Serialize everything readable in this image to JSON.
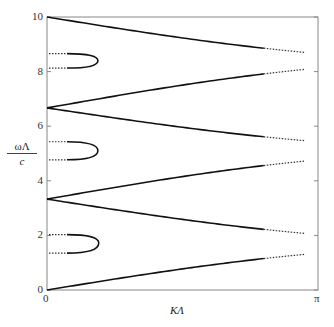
{
  "chart_data": {
    "type": "line",
    "title": "",
    "xlabel": "KΛ",
    "ylabel_numerator": "ωΛ",
    "ylabel_denominator": "c",
    "xlim": [
      0,
      3.14159
    ],
    "ylim": [
      0,
      10
    ],
    "grid": false,
    "legend": null,
    "x_ticks": [
      {
        "value": 0,
        "label": "0"
      },
      {
        "value": 3.14159,
        "label": "π"
      }
    ],
    "y_ticks": [
      {
        "value": 0,
        "label": "0"
      },
      {
        "value": 2,
        "label": "2"
      },
      {
        "value": 4,
        "label": "4"
      },
      {
        "value": 6,
        "label": "6"
      },
      {
        "value": 8,
        "label": "8"
      },
      {
        "value": 10,
        "label": "10"
      }
    ],
    "series": [
      {
        "name": "band-1",
        "style": "solid-then-dotted",
        "x_start": 0,
        "y_start": 0,
        "x_end": 3.14159,
        "y_end": 1.35
      },
      {
        "name": "band-2",
        "style": "solid-then-dotted",
        "x_start": 0,
        "y_start": 3.33,
        "x_end": 3.14159,
        "y_end": 2.03
      },
      {
        "name": "band-3",
        "style": "solid-then-dotted",
        "x_start": 0,
        "y_start": 3.33,
        "x_end": 3.14159,
        "y_end": 4.77
      },
      {
        "name": "band-4",
        "style": "solid-then-dotted",
        "x_start": 0,
        "y_start": 6.67,
        "x_end": 3.14159,
        "y_end": 5.43
      },
      {
        "name": "band-5",
        "style": "solid-then-dotted",
        "x_start": 0,
        "y_start": 6.67,
        "x_end": 3.14159,
        "y_end": 8.13
      },
      {
        "name": "band-6",
        "style": "solid-then-dotted",
        "x_start": 0,
        "y_start": 10,
        "x_end": 3.14159,
        "y_end": 8.66
      }
    ],
    "gap_loops": [
      {
        "name": "gap-1",
        "y_low": 1.35,
        "y_high": 2.03,
        "tip_x": 0.6,
        "tip_y": 1.72
      },
      {
        "name": "gap-2",
        "y_low": 4.77,
        "y_high": 5.43,
        "tip_x": 0.59,
        "tip_y": 5.1
      },
      {
        "name": "gap-3",
        "y_low": 8.13,
        "y_high": 8.66,
        "tip_x": 0.59,
        "tip_y": 8.4
      }
    ]
  }
}
